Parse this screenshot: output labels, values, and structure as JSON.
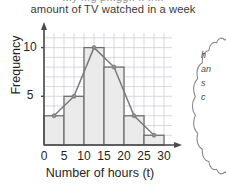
{
  "title": {
    "line1": "...y ...g p...gg.. .. .h..",
    "line2": "amount of TV watched in a week"
  },
  "chart_data": {
    "type": "bar",
    "title": "amount of TV watched in a week",
    "xlabel": "Number of hours (t)",
    "ylabel": "Frequency",
    "categories": [
      "0-5",
      "5-10",
      "10-15",
      "15-20",
      "20-25",
      "25-30"
    ],
    "values": [
      3,
      5,
      10,
      8,
      3,
      1
    ],
    "bin_edges": [
      0,
      5,
      10,
      15,
      20,
      25,
      30
    ],
    "midpoints": [
      2.5,
      7.5,
      12.5,
      17.5,
      22.5,
      27.5
    ],
    "polygon_points": [
      [
        2.5,
        3
      ],
      [
        7.5,
        5
      ],
      [
        12.5,
        10
      ],
      [
        17.5,
        8
      ],
      [
        22.5,
        3
      ],
      [
        27.5,
        1
      ]
    ],
    "xlim": [
      0,
      32
    ],
    "ylim": [
      0,
      11.5
    ],
    "xticks": [
      "0",
      "5",
      "10",
      "15",
      "20",
      "25",
      "30"
    ],
    "yticks": [
      "5",
      "10"
    ],
    "ytick_values": [
      5,
      10
    ],
    "grid": true,
    "legend": "none",
    "bar_fill": "#ebebeb",
    "bar_stroke": "#6f6f6f",
    "polygon_stroke": "#7a7a7a",
    "grid_color": "#c9c9d6",
    "axis_color": "#4a4a4a"
  },
  "callout": {
    "line1": "h",
    "line2": "an",
    "line3": "",
    "line4": "s",
    "line5": "c",
    "line6": ""
  }
}
